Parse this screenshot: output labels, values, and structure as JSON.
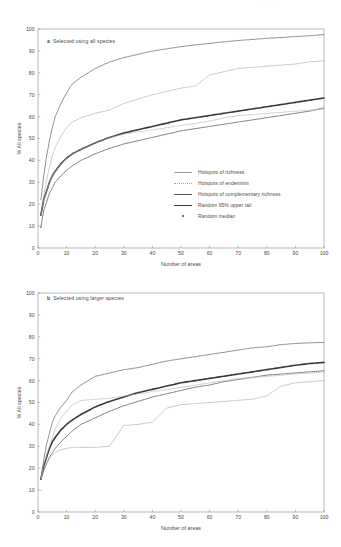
{
  "figure": {
    "top_artifact": "–  –",
    "panels": [
      {
        "id": "a",
        "letter": "a",
        "caption": "Selected using all species",
        "xlabel": "Number of areas",
        "ylabel": "% All species"
      },
      {
        "id": "b",
        "letter": "b",
        "caption": "Selected using larger species",
        "xlabel": "Number of areas",
        "ylabel": "% All species"
      }
    ]
  },
  "legend": {
    "position": "inside-lower-right-panel-a",
    "entries": [
      {
        "label": "Hotspots of richness",
        "key": "thin-light-line",
        "color": "#9b9b9b"
      },
      {
        "label": "Hotspots of endemism",
        "key": "dotted-light-line",
        "color": "#a8a8a8"
      },
      {
        "label": "Hotspots of complementary richness",
        "key": "thin-dark-line",
        "color": "#555555"
      },
      {
        "label": "Random 95% upper tail",
        "key": "thick-dark-line",
        "color": "#3a3a3a"
      },
      {
        "label": "Random median",
        "key": "dotted-dark-marker",
        "color": "#3a3a3a"
      }
    ]
  },
  "axes": {
    "x_ticks": [
      0,
      10,
      20,
      30,
      40,
      50,
      60,
      70,
      80,
      90,
      100
    ],
    "y_ticks": [
      0,
      10,
      20,
      30,
      40,
      50,
      60,
      70,
      80,
      90,
      100
    ],
    "xlim": [
      0,
      100
    ],
    "ylim": [
      0,
      100
    ],
    "grid": false
  },
  "chart_data": [
    {
      "type": "line",
      "title": "a Selected using all species",
      "xlabel": "Number of areas",
      "ylabel": "% All species",
      "xlim": [
        0,
        100
      ],
      "ylim": [
        0,
        100
      ],
      "grid": false,
      "legend_position": "lower right (inside axes)",
      "x": [
        1,
        2,
        3,
        4,
        5,
        6,
        8,
        10,
        12,
        15,
        20,
        25,
        30,
        35,
        40,
        45,
        50,
        55,
        60,
        65,
        70,
        75,
        80,
        85,
        90,
        95,
        100
      ],
      "series": [
        {
          "name": "Hotspots of complementary richness",
          "style": "solid thin dark",
          "values": [
            22,
            33,
            42,
            49,
            55,
            60,
            66,
            71,
            75,
            78,
            82,
            85,
            87,
            88.5,
            90,
            91,
            92,
            92.8,
            93.5,
            94.2,
            94.8,
            95.3,
            95.8,
            96.2,
            96.6,
            97,
            97.5
          ]
        },
        {
          "name": "Hotspots of endemism",
          "style": "dotted light",
          "values": [
            15,
            24,
            31,
            37,
            42,
            46,
            51,
            55,
            57.5,
            59.5,
            61.5,
            63,
            66,
            68,
            70,
            71.5,
            73,
            74,
            79,
            80.5,
            82,
            82.5,
            83,
            83.5,
            84,
            85,
            85.5
          ]
        },
        {
          "name": "Random 95% upper tail",
          "style": "solid thick dark",
          "values": [
            15,
            22,
            26,
            30,
            33,
            35,
            38.5,
            41,
            43,
            45,
            48,
            50.5,
            52.5,
            54,
            55.5,
            57,
            58.5,
            59.5,
            60.5,
            61.5,
            62.5,
            63.5,
            64.5,
            65.5,
            66.5,
            67.5,
            68.5
          ]
        },
        {
          "name": "Random median",
          "style": "dotted dark",
          "values": [
            9.5,
            17,
            21,
            25,
            27.5,
            30,
            33,
            35.5,
            37.5,
            40,
            43,
            45.5,
            47.5,
            49,
            50.5,
            52,
            53.5,
            54.5,
            55.5,
            56.5,
            57.5,
            58.5,
            59.5,
            60.5,
            61.5,
            62.5,
            64
          ]
        },
        {
          "name": "Hotspots of richness",
          "style": "solid thin light",
          "values": [
            15,
            22,
            26,
            30,
            33,
            35,
            38.5,
            41,
            43,
            45,
            48,
            50.5,
            52,
            53,
            54,
            55,
            56,
            57,
            58,
            59.5,
            60.5,
            61,
            61.5,
            62,
            62.5,
            63,
            63.5
          ]
        }
      ]
    },
    {
      "type": "line",
      "title": "b Selected using larger species",
      "xlabel": "Number of areas",
      "ylabel": "% All species",
      "xlim": [
        0,
        100
      ],
      "ylim": [
        0,
        100
      ],
      "grid": false,
      "legend_position": "none (shared with panel a)",
      "x": [
        1,
        2,
        3,
        4,
        5,
        6,
        8,
        10,
        12,
        15,
        20,
        25,
        30,
        35,
        40,
        45,
        50,
        55,
        60,
        65,
        70,
        75,
        80,
        85,
        90,
        95,
        100
      ],
      "series": [
        {
          "name": "Hotspots of complementary richness",
          "style": "solid thin dark",
          "values": [
            15,
            24,
            31,
            36,
            41,
            44,
            48,
            51,
            55,
            58,
            62,
            63.5,
            65,
            66,
            67.5,
            69,
            70,
            71,
            72,
            73,
            74,
            75,
            75.5,
            76.5,
            77,
            77.3,
            77.5
          ]
        },
        {
          "name": "Random 95% upper tail",
          "style": "solid thick dark",
          "values": [
            15,
            21,
            25,
            29,
            32,
            34,
            37.5,
            40,
            42,
            44.5,
            48,
            50.5,
            52.5,
            54.5,
            56,
            57.5,
            59,
            60,
            61,
            62,
            63,
            64,
            65,
            66,
            67,
            67.8,
            68.3
          ]
        },
        {
          "name": "Random median",
          "style": "dotted dark",
          "values": [
            15,
            19,
            22,
            25,
            27,
            29,
            32,
            34.5,
            37,
            40,
            43,
            46,
            48.5,
            50.5,
            52.5,
            54,
            55.5,
            57,
            58,
            59.5,
            60.5,
            61.5,
            62.5,
            63,
            63.5,
            64,
            64.5
          ]
        },
        {
          "name": "Hotspots of endemism",
          "style": "dotted light",
          "values": [
            15,
            19,
            22,
            24.5,
            26,
            27,
            28.5,
            29,
            29.5,
            29.5,
            29.5,
            30,
            39.5,
            40,
            41,
            47.5,
            49,
            49.5,
            50,
            50.5,
            51,
            51.5,
            53,
            57.5,
            59,
            59.5,
            60
          ]
        },
        {
          "name": "Hotspots of richness",
          "style": "solid thin light",
          "values": [
            15,
            22,
            26,
            30,
            34,
            38,
            43,
            46,
            49,
            51,
            51.5,
            52,
            53,
            54,
            55,
            56,
            57,
            58,
            59,
            60,
            61,
            61.5,
            62,
            62.5,
            63,
            63.5,
            64
          ]
        }
      ]
    }
  ]
}
